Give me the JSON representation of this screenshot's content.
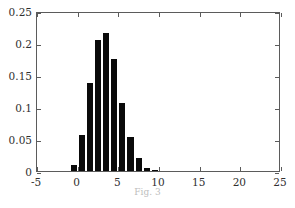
{
  "chart_data": {
    "type": "bar",
    "title": "",
    "subtitle": "",
    "xlabel": "",
    "ylabel": "",
    "xlim": [
      -5,
      25
    ],
    "ylim": [
      0,
      0.25
    ],
    "grid": false,
    "legend": null,
    "bar_color": "#0a0a0a",
    "axis_color": "#5b5b5b",
    "bin_width": 1,
    "xtick_labels": [
      "-5",
      "0",
      "5",
      "10",
      "15",
      "20",
      "25"
    ],
    "xtick_values": [
      -5,
      0,
      5,
      10,
      15,
      20,
      25
    ],
    "ytick_labels": [
      "0",
      "0.05",
      "0.1",
      "0.15",
      "0.2",
      "0.25"
    ],
    "ytick_values": [
      0,
      0.05,
      0.1,
      0.15,
      0.2,
      0.25
    ],
    "categories": [
      "-0.5",
      "0.5",
      "1.5",
      "2.5",
      "3.5",
      "4.5",
      "5.5",
      "6.5",
      "7.5",
      "8.5",
      "9.5",
      "10.5"
    ],
    "x": [
      -0.5,
      0.5,
      1.5,
      2.5,
      3.5,
      4.5,
      5.5,
      6.5,
      7.5,
      8.5,
      9.5,
      10.5
    ],
    "values": [
      0.01,
      0.057,
      0.137,
      0.204,
      0.216,
      0.175,
      0.107,
      0.053,
      0.021,
      0.005,
      0.001,
      0.0
    ]
  },
  "caption": "Fig. 3"
}
